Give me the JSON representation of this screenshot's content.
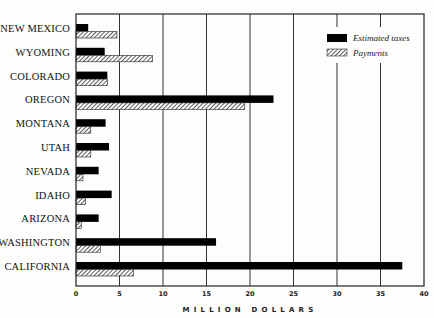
{
  "chart_data": {
    "type": "bar",
    "orientation": "horizontal",
    "title": "",
    "xlabel": "MILLION DOLLARS",
    "ylabel": "",
    "xlim": [
      0,
      40
    ],
    "xticks": [
      0,
      5,
      10,
      15,
      20,
      25,
      30,
      35,
      40
    ],
    "grid": "vertical",
    "legend_position": "upper right",
    "categories": [
      "NEW MEXICO",
      "WYOMING",
      "COLORADO",
      "OREGON",
      "MONTANA",
      "UTAH",
      "NEVADA",
      "IDAHO",
      "ARIZONA",
      "WASHINGTON",
      "CALIFORNIA"
    ],
    "series": [
      {
        "name": "Estimated taxes",
        "style": "solid",
        "color": "#000000",
        "values": [
          1.4,
          3.3,
          3.6,
          22.7,
          3.4,
          3.8,
          2.6,
          4.1,
          2.6,
          16.1,
          37.5
        ]
      },
      {
        "name": "Payments",
        "style": "hatched",
        "color": "#555555",
        "values": [
          4.7,
          8.8,
          3.6,
          19.4,
          1.7,
          1.7,
          0.8,
          1.1,
          0.6,
          2.8,
          6.6
        ]
      }
    ]
  }
}
